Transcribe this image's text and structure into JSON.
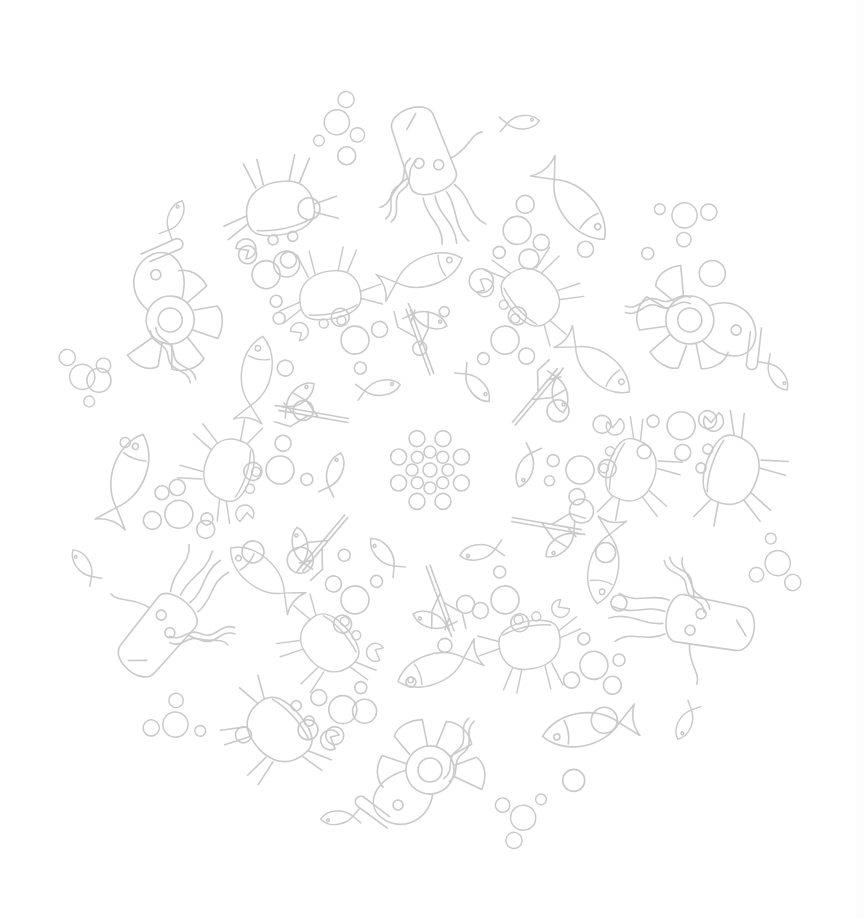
{
  "page": {
    "background": "#ffffff",
    "line_color": "#c9c9c9"
  },
  "mandala": {
    "center": [
      430,
      470
    ],
    "radius": 390,
    "motifs": [
      "fish",
      "crab",
      "squid",
      "shrimp",
      "bubbles",
      "coral",
      "worm"
    ],
    "rings": [
      {
        "name": "outer",
        "radius": 300,
        "items": [
          "squid",
          "fish",
          "shrimp",
          "crab"
        ],
        "count": 6
      },
      {
        "name": "middle",
        "radius": 190,
        "items": [
          "fish",
          "crab"
        ],
        "count": 6
      },
      {
        "name": "inner",
        "radius": 95,
        "items": [
          "coral",
          "fish"
        ],
        "count": 6
      }
    ]
  }
}
